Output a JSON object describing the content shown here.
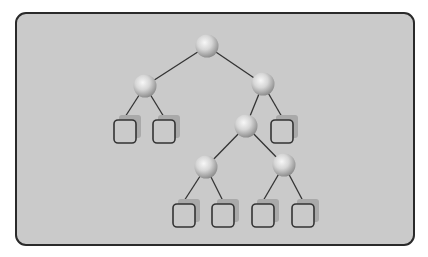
{
  "diagram": {
    "type": "binary-tree",
    "colors": {
      "background": "#cacaca",
      "frame_border": "#2a2a2a",
      "edge": "#333333",
      "node_light": "#f4f4f4",
      "node_dark": "#8e8e8e",
      "leaf_border": "#333333",
      "leaf_shadow": "#a9a9a9"
    },
    "nodes": [
      {
        "id": "root",
        "x": 207,
        "y": 46
      },
      {
        "id": "L",
        "x": 145,
        "y": 86
      },
      {
        "id": "R",
        "x": 263,
        "y": 84
      },
      {
        "id": "RL",
        "x": 246,
        "y": 126
      },
      {
        "id": "RLL",
        "x": 206,
        "y": 167
      },
      {
        "id": "RLR",
        "x": 284,
        "y": 165
      }
    ],
    "leaves": [
      {
        "id": "L-a",
        "x": 114,
        "y": 120
      },
      {
        "id": "L-b",
        "x": 153,
        "y": 120
      },
      {
        "id": "R-b",
        "x": 271,
        "y": 120
      },
      {
        "id": "RLL-a",
        "x": 173,
        "y": 204
      },
      {
        "id": "RLL-b",
        "x": 212,
        "y": 204
      },
      {
        "id": "RLR-a",
        "x": 252,
        "y": 204
      },
      {
        "id": "RLR-b",
        "x": 292,
        "y": 204
      }
    ],
    "edges": [
      [
        "root",
        "L"
      ],
      [
        "root",
        "R"
      ],
      [
        "L",
        "L-a"
      ],
      [
        "L",
        "L-b"
      ],
      [
        "R",
        "RL"
      ],
      [
        "R",
        "R-b"
      ],
      [
        "RL",
        "RLL"
      ],
      [
        "RL",
        "RLR"
      ],
      [
        "RLL",
        "RLL-a"
      ],
      [
        "RLL",
        "RLL-b"
      ],
      [
        "RLR",
        "RLR-a"
      ],
      [
        "RLR",
        "RLR-b"
      ]
    ]
  }
}
